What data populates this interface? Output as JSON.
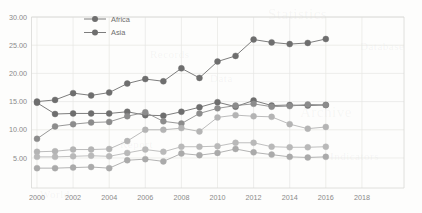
{
  "chart_data": {
    "type": "line",
    "title": "",
    "subtitle": "",
    "xlabel": "",
    "ylabel": "",
    "xlim": [
      2000,
      2018
    ],
    "ylim": [
      0,
      30
    ],
    "ytick_labels": [
      "30.00",
      "25.00",
      "20.00",
      "15.00",
      "10.00",
      "5.00"
    ],
    "ytick_values": [
      30,
      25,
      20,
      15,
      10,
      5
    ],
    "xtick_labels": [
      "2000",
      "2002",
      "2004",
      "2006",
      "2008",
      "2010",
      "2012",
      "2014",
      "2016",
      "2018"
    ],
    "xtick_values": [
      2000,
      2002,
      2004,
      2006,
      2008,
      2010,
      2012,
      2014,
      2016,
      2018
    ],
    "grid": true,
    "legend_position": "top-center",
    "legend_entries": [
      "Africa",
      "Asia"
    ],
    "x": [
      2000,
      2001,
      2002,
      2003,
      2004,
      2005,
      2006,
      2007,
      2008,
      2009,
      2010,
      2011,
      2012,
      2013,
      2014,
      2015,
      2016
    ],
    "series": [
      {
        "name": "Africa",
        "color": "#6e6e6e",
        "values": [
          15.0,
          15.3,
          16.5,
          16.1,
          16.6,
          18.2,
          19.0,
          18.6,
          20.9,
          19.2,
          22.1,
          23.1,
          26.0,
          25.5,
          25.2,
          25.4,
          26.1
        ]
      },
      {
        "name": "Asia",
        "color": "#6e6e6e",
        "values": [
          14.8,
          12.8,
          12.9,
          12.9,
          12.9,
          13.2,
          12.6,
          12.5,
          13.2,
          14.0,
          14.9,
          14.1,
          15.2,
          14.3,
          14.4,
          14.3,
          14.4
        ]
      },
      {
        "name": "series-3",
        "color": "#8c8c8c",
        "values": [
          8.4,
          10.6,
          11.0,
          11.3,
          11.4,
          12.4,
          13.1,
          11.5,
          11.1,
          12.9,
          13.8,
          14.3,
          14.6,
          14.1,
          14.2,
          14.5,
          14.4
        ]
      },
      {
        "name": "series-4",
        "color": "#b4b4b4",
        "values": [
          6.1,
          6.2,
          6.5,
          6.5,
          6.6,
          8.0,
          10.0,
          10.0,
          10.3,
          9.7,
          12.2,
          12.6,
          12.4,
          12.3,
          11.0,
          10.2,
          10.5
        ]
      },
      {
        "name": "series-5",
        "color": "#b9b9b9",
        "values": [
          5.2,
          5.2,
          5.3,
          5.4,
          5.3,
          5.9,
          6.5,
          6.1,
          7.0,
          7.0,
          7.1,
          7.7,
          7.7,
          7.0,
          6.9,
          6.9,
          7.0
        ]
      },
      {
        "name": "series-6",
        "color": "#aaaaaa",
        "values": [
          3.2,
          3.2,
          3.3,
          3.4,
          3.2,
          4.6,
          4.8,
          4.4,
          5.8,
          5.5,
          5.9,
          6.6,
          6.0,
          5.6,
          5.2,
          5.1,
          5.2
        ]
      }
    ]
  },
  "watermarks": [
    {
      "text": "Statistics",
      "x": 268,
      "y": 6,
      "big": true
    },
    {
      "text": "Records",
      "x": 150,
      "y": 48,
      "big": false
    },
    {
      "text": "Data",
      "x": 210,
      "y": 72,
      "big": false
    },
    {
      "text": "Archive",
      "x": 300,
      "y": 104,
      "big": true
    },
    {
      "text": "Report",
      "x": 120,
      "y": 138,
      "big": false
    },
    {
      "text": "Indicators",
      "x": 330,
      "y": 150,
      "big": false
    },
    {
      "text": "World",
      "x": 40,
      "y": 188,
      "big": false
    },
    {
      "text": "Database",
      "x": 360,
      "y": 40,
      "big": false
    }
  ]
}
